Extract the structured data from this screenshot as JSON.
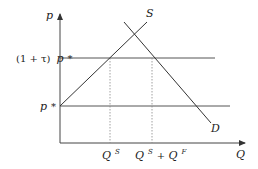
{
  "diagram": {
    "type": "supply-demand",
    "y_axis_label": "p",
    "x_axis_label": "Q",
    "supply_label": "S",
    "demand_label": "D",
    "price_upper_prefix": "(1 + τ)",
    "price_upper_var": "p",
    "price_upper_star": "*",
    "price_lower_var": "p",
    "price_lower_star": "*",
    "qty_1_base": "Q",
    "qty_1_sup": "S",
    "qty_2_base_a": "Q",
    "qty_2_sup_a": "S",
    "qty_2_plus": " + ",
    "qty_2_base_b": "Q",
    "qty_2_sup_b": "F"
  },
  "colors": {
    "line": "#333333",
    "dotted": "#888888",
    "hline": "#555555"
  }
}
